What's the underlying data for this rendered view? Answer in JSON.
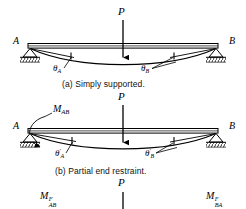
{
  "figure": {
    "ink_color": "#000000",
    "paper_color": "#ffffff"
  },
  "panels": [
    {
      "id": "a",
      "caption": "(a) Simply supported.",
      "support_left_label": "A",
      "support_right_label": "B",
      "load_label": "P",
      "angle_left": {
        "theta": "θ",
        "sub": "A",
        "prime": ""
      },
      "angle_right": {
        "theta": "θ",
        "sub": "B",
        "prime": ""
      },
      "moment_label": null
    },
    {
      "id": "b",
      "caption": "(b) Partial end restraint.",
      "support_left_label": "A",
      "support_right_label": "B",
      "load_label": "P",
      "angle_left": {
        "theta": "θ",
        "sub": "A",
        "prime": "′"
      },
      "angle_right": {
        "theta": "θ",
        "sub": "B",
        "prime": "′"
      },
      "moment_label": {
        "base": "M",
        "sub": "AB"
      }
    },
    {
      "id": "c",
      "caption": "",
      "load_label": "P",
      "moment_left": {
        "base": "M",
        "sup": "F",
        "sub": "AB"
      },
      "moment_right": {
        "base": "M",
        "sup": "F",
        "sub": "BA"
      }
    }
  ],
  "labels": {
    "A": "A",
    "B": "B",
    "P": "P",
    "theta_A": "θ",
    "theta_B": "θ",
    "sub_A": "A",
    "sub_B": "B",
    "prime": "′",
    "M": "M",
    "sub_AB": "AB",
    "sub_BA": "BA",
    "sup_F": "F",
    "caption_a": "(a) Simply supported.",
    "caption_b": "(b) Partial end restraint."
  }
}
